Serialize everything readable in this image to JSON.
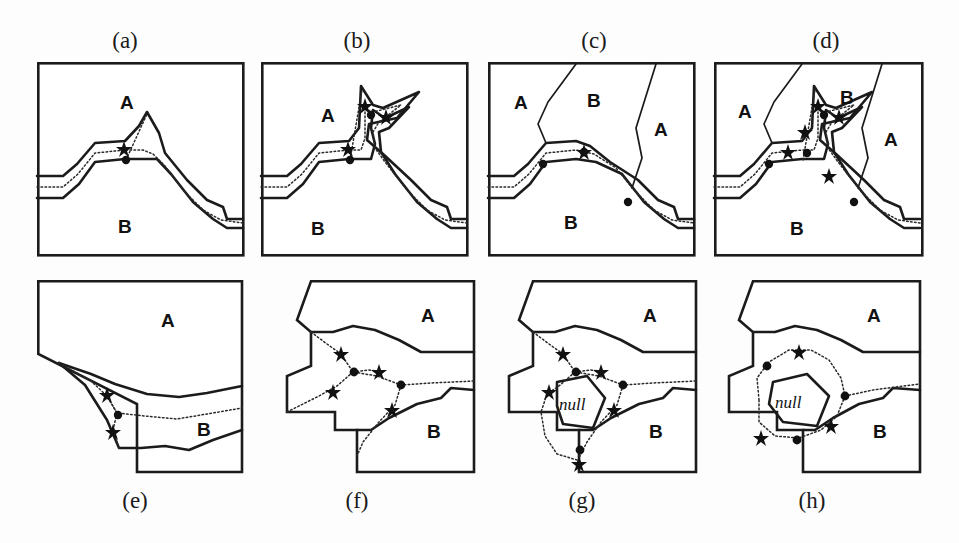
{
  "figure": {
    "width": 959,
    "height": 543,
    "background": "#ffffff",
    "ink_color": "#1b1b1b"
  },
  "legend_semantics": {
    "solid_thick": "region boundary line",
    "dotted": "skeleton / medial axis centerline",
    "dot_marker": "junction node",
    "star_marker": "branch / skeleton point"
  },
  "panels": [
    {
      "id": "a",
      "caption": "(a)",
      "caption_position": "top",
      "caption_x": 125,
      "caption_y": 30,
      "frame": {
        "x": 37,
        "y": 62,
        "w": 206,
        "h": 193
      },
      "region_labels": [
        {
          "text": "A",
          "x": 120,
          "y": 102
        },
        {
          "text": "B",
          "x": 118,
          "y": 226
        }
      ],
      "null_labels": [],
      "dot_count": 1,
      "star_count": 1
    },
    {
      "id": "b",
      "caption": "(b)",
      "caption_position": "top",
      "caption_x": 357,
      "caption_y": 30,
      "frame": {
        "x": 261,
        "y": 62,
        "w": 206,
        "h": 193
      },
      "region_labels": [
        {
          "text": "A",
          "x": 328,
          "y": 115
        },
        {
          "text": "B",
          "x": 318,
          "y": 228
        }
      ],
      "null_labels": [],
      "dot_count": 2,
      "star_count": 3
    },
    {
      "id": "c",
      "caption": "(c)",
      "caption_position": "top",
      "caption_x": 594,
      "caption_y": 30,
      "frame": {
        "x": 488,
        "y": 62,
        "w": 206,
        "h": 193
      },
      "region_labels": [
        {
          "text": "A",
          "x": 521,
          "y": 103
        },
        {
          "text": "B",
          "x": 594,
          "y": 100
        },
        {
          "text": "A",
          "x": 660,
          "y": 130
        },
        {
          "text": "B",
          "x": 570,
          "y": 222
        }
      ],
      "null_labels": [],
      "dot_count": 3,
      "star_count": 1
    },
    {
      "id": "d",
      "caption": "(d)",
      "caption_position": "top",
      "caption_x": 826,
      "caption_y": 30,
      "frame": {
        "x": 714,
        "y": 62,
        "w": 208,
        "h": 193
      },
      "region_labels": [
        {
          "text": "A",
          "x": 744,
          "y": 112
        },
        {
          "text": "B",
          "x": 846,
          "y": 98
        },
        {
          "text": "A",
          "x": 890,
          "y": 140
        },
        {
          "text": "B",
          "x": 796,
          "y": 228
        }
      ],
      "null_labels": [],
      "dot_count": 4,
      "star_count": 5
    },
    {
      "id": "e",
      "caption": "(e)",
      "caption_position": "bottom",
      "caption_x": 135,
      "caption_y": 490,
      "frame": {
        "x": 37,
        "y": 280,
        "w": 206,
        "h": 192
      },
      "region_labels": [
        {
          "text": "A",
          "x": 168,
          "y": 320
        },
        {
          "text": "B",
          "x": 205,
          "y": 430
        }
      ],
      "null_labels": [],
      "dot_count": 1,
      "star_count": 2
    },
    {
      "id": "f",
      "caption": "(f)",
      "caption_position": "bottom",
      "caption_x": 357,
      "caption_y": 490,
      "frame": {
        "x": 275,
        "y": 280,
        "w": 200,
        "h": 192
      },
      "region_labels": [
        {
          "text": "A",
          "x": 427,
          "y": 313
        },
        {
          "text": "B",
          "x": 432,
          "y": 432
        }
      ],
      "null_labels": [],
      "dot_count": 2,
      "star_count": 4
    },
    {
      "id": "g",
      "caption": "(g)",
      "caption_position": "bottom",
      "caption_x": 582,
      "caption_y": 490,
      "frame": {
        "x": 497,
        "y": 280,
        "w": 200,
        "h": 192
      },
      "region_labels": [
        {
          "text": "A",
          "x": 650,
          "y": 315
        },
        {
          "text": "B",
          "x": 655,
          "y": 435
        }
      ],
      "null_labels": [
        {
          "text": "null",
          "x": 552,
          "y": 420
        }
      ],
      "dot_count": 3,
      "star_count": 5
    },
    {
      "id": "h",
      "caption": "(h)",
      "caption_position": "bottom",
      "caption_x": 812,
      "caption_y": 490,
      "frame": {
        "x": 717,
        "y": 280,
        "w": 205,
        "h": 192
      },
      "region_labels": [
        {
          "text": "A",
          "x": 878,
          "y": 315
        },
        {
          "text": "B",
          "x": 882,
          "y": 435
        }
      ],
      "null_labels": [
        {
          "text": "null",
          "x": 790,
          "y": 405
        }
      ],
      "dot_count": 3,
      "star_count": 3
    }
  ]
}
